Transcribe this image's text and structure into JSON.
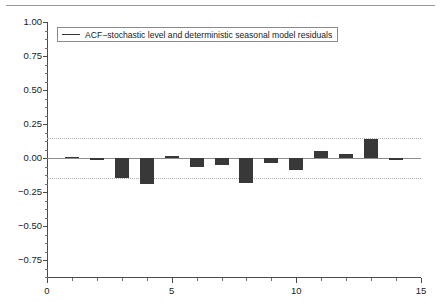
{
  "figure": {
    "background_color": "#ffffff",
    "top_rule_color": "#9a9a9a"
  },
  "legend": {
    "label": "ACF−stochastic level and deterministic seasonal model residuals",
    "swatch_color": "#383838",
    "border_color": "#8a8a8a",
    "position": "top-left inside axes"
  },
  "axes": {
    "x_tick_labels": [
      "0",
      "5",
      "10",
      "15"
    ],
    "y_tick_labels": [
      "1.00",
      "0.75",
      "0.50",
      "0.25",
      "0.00",
      "−0.25",
      "−0.50",
      "−0.75"
    ],
    "x_axis_color": "#4a4a4a",
    "y_axis_color": "#4a4a4a"
  },
  "reference_lines": {
    "zero_line_color": "#8d8d8d",
    "confidence_line_color": "#b0b0b0",
    "confidence_level_upper": 0.15,
    "confidence_level_lower": -0.15
  },
  "chart_data": {
    "type": "bar",
    "title": "",
    "subtitle": "",
    "xlabel": "",
    "ylabel": "",
    "xlim": [
      0,
      15
    ],
    "ylim": [
      -0.875,
      1.0
    ],
    "grid": false,
    "legend_position": "upper left",
    "bar_color": "#383838",
    "series_name": "ACF−stochastic level and deterministic seasonal model residuals",
    "x_ticks": [
      0,
      5,
      10,
      15
    ],
    "y_ticks": [
      1.0,
      0.75,
      0.5,
      0.25,
      0.0,
      -0.25,
      -0.5,
      -0.75
    ],
    "x_minor_ticks": [
      1,
      2,
      3,
      4,
      6,
      7,
      8,
      9,
      11,
      12,
      13,
      14
    ],
    "confidence_bands": [
      0.15,
      -0.15
    ],
    "categories": [
      1,
      2,
      3,
      4,
      5,
      6,
      7,
      8,
      9,
      10,
      11,
      12,
      13,
      14
    ],
    "values": [
      0.01,
      -0.012,
      -0.145,
      -0.19,
      0.012,
      -0.065,
      -0.05,
      -0.185,
      -0.035,
      -0.09,
      0.05,
      0.03,
      0.14,
      -0.012
    ],
    "annotations": []
  }
}
